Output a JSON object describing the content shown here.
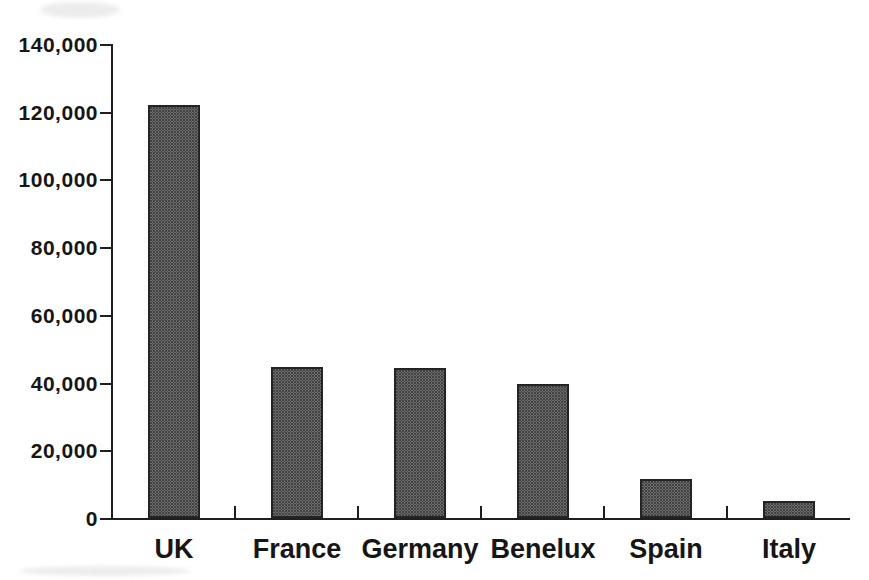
{
  "chart_data": {
    "type": "bar",
    "title": "",
    "xlabel": "",
    "ylabel": "",
    "categories": [
      "UK",
      "France",
      "Germany",
      "Benelux",
      "Spain",
      "Italy"
    ],
    "values": [
      122000,
      44500,
      44300,
      39500,
      11500,
      5000
    ],
    "ylim": [
      0,
      140000
    ],
    "ytick_interval": 20000,
    "ytick_labels": [
      "0",
      "20,000",
      "40,000",
      "60,000",
      "80,000",
      "100,000",
      "120,000",
      "140,000"
    ],
    "grid": false,
    "legend": false,
    "bar_fill_color": "#989898",
    "bar_dot_color": "#424242",
    "bar_border_color": "#242424",
    "axis_color": "#1f1f1f",
    "text_color": "#161616",
    "background_color": "#ffffff"
  }
}
